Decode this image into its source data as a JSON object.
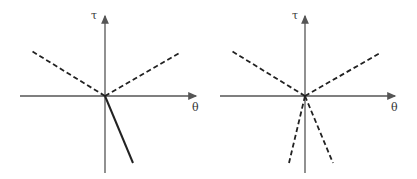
{
  "panels": [
    {
      "name": "left",
      "axis_labels": {
        "y": "τ",
        "x": "θ"
      },
      "origin": [
        105,
        96
      ],
      "lines": [
        {
          "style": "dashed",
          "to": [
            30,
            50
          ]
        },
        {
          "style": "dashed",
          "to": [
            181,
            52
          ]
        },
        {
          "style": "solid",
          "to": [
            133,
            163
          ]
        }
      ]
    },
    {
      "name": "right",
      "axis_labels": {
        "y": "τ",
        "x": "θ"
      },
      "origin": [
        305,
        96
      ],
      "lines": [
        {
          "style": "dashed",
          "to": [
            230,
            50
          ]
        },
        {
          "style": "dashed",
          "to": [
            380,
            53
          ]
        },
        {
          "style": "dashed",
          "to": [
            289,
            163
          ]
        },
        {
          "style": "dashed",
          "to": [
            333,
            163
          ]
        }
      ]
    }
  ],
  "colors": {
    "axis": "#555555",
    "line": "#222222"
  }
}
